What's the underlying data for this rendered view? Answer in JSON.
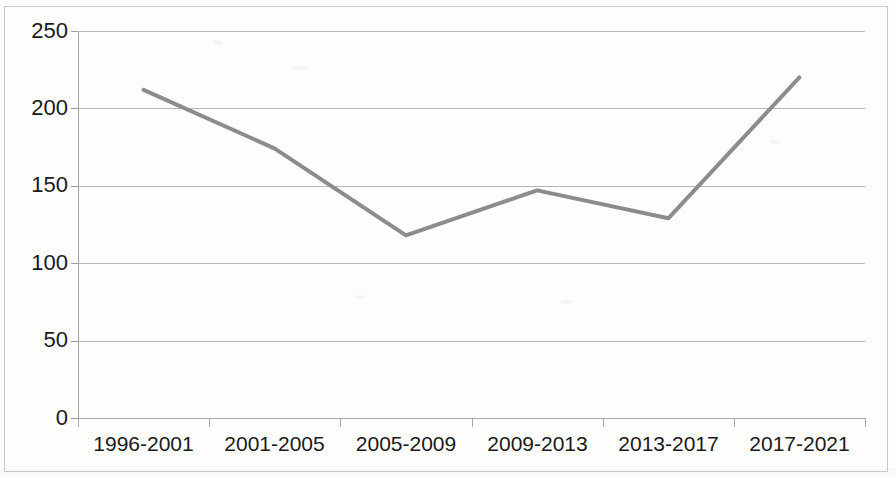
{
  "chart_data": {
    "type": "line",
    "title": "",
    "subtitle": "",
    "xlabel": "",
    "ylabel": "",
    "categories": [
      "1996-2001",
      "2001-2005",
      "2005-2009",
      "2009-2013",
      "2013-2017",
      "2017-2021"
    ],
    "values": [
      212,
      174,
      118,
      147,
      129,
      220
    ],
    "series": [
      {
        "name": "",
        "values": [
          212,
          174,
          118,
          147,
          129,
          220
        ]
      }
    ],
    "ylim": [
      0,
      250
    ],
    "yticks": [
      0,
      50,
      100,
      150,
      200,
      250
    ],
    "ytick_labels": [
      "0",
      "50",
      "100",
      "150",
      "200",
      "250"
    ],
    "grid": true,
    "grid_axis": "y",
    "legend": false,
    "legend_position": "none",
    "markers": false,
    "line_color": "#8c8c8c",
    "line_width": 4,
    "annotations": []
  },
  "axes": {
    "y_labels": [
      "250",
      "200",
      "150",
      "100",
      "50",
      "0"
    ],
    "x_labels": [
      "1996-2001",
      "2001-2005",
      "2005-2009",
      "2009-2013",
      "2013-2017",
      "2017-2021"
    ]
  },
  "colors": {
    "line": "#8c8c8c",
    "gridline": "#b6b6b6",
    "axis": "#a0a0a0",
    "text": "#1a1a1a",
    "frame": "#c9c9c9",
    "background": "#fdfdfc"
  }
}
